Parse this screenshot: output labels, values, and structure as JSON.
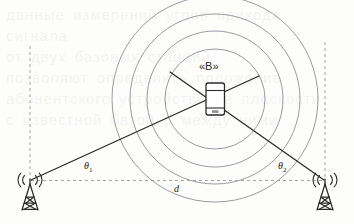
{
  "figure": {
    "background_color": "#fdfdfc",
    "ink_color": "#2b2b2b",
    "circle_color": "#8f8f96",
    "dash_color": "#9a9aa2"
  },
  "labels": {
    "device": "«B»",
    "theta1": "θ",
    "theta1_sub": "1",
    "theta2": "θ",
    "theta2_sub": "2",
    "baseline": "d"
  },
  "icons": {
    "left_tower": "cell-tower-icon",
    "right_tower": "cell-tower-icon",
    "device": "smartphone-icon",
    "waves": "signal-waves-icon"
  },
  "geometry": {
    "device_center": {
      "x": 215,
      "y": 99
    },
    "circle_radii": [
      50,
      68,
      85,
      103
    ],
    "left_tower": {
      "x": 30,
      "y": 181
    },
    "right_tower": {
      "x": 325,
      "y": 181
    },
    "baseline_y": 181,
    "bearing_line_1": {
      "x1": 31,
      "y1": 180,
      "x2": 258,
      "y2": 76
    },
    "bearing_line_2": {
      "x1": 324,
      "y1": 180,
      "x2": 170,
      "y2": 72
    }
  },
  "background_text": {
    "lines": [
      "данные измерений углов прихода сигнала",
      "от двух базовых станций",
      "позволяют определить положение",
      "абонентского устройства на плоскости",
      "с известной базой d между ними"
    ]
  }
}
